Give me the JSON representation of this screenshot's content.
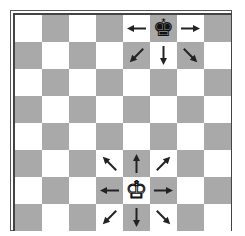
{
  "board": {
    "size": 8,
    "colors": {
      "light": "#ffffff",
      "dark": "#a9a9a9",
      "arrow": "#222222",
      "frame": "#444444"
    },
    "top_left_square": "light"
  },
  "pieces": [
    {
      "name": "black-king",
      "glyph": "♚",
      "color": "black",
      "col": 5,
      "row": 0,
      "square": "f8"
    },
    {
      "name": "white-king",
      "glyph": "♔",
      "color": "white",
      "col": 4,
      "row": 6,
      "square": "e2"
    }
  ],
  "arrows": [
    {
      "piece": "black-king",
      "col": 4,
      "row": 0,
      "dir": "w"
    },
    {
      "piece": "black-king",
      "col": 6,
      "row": 0,
      "dir": "e"
    },
    {
      "piece": "black-king",
      "col": 4,
      "row": 1,
      "dir": "sw"
    },
    {
      "piece": "black-king",
      "col": 5,
      "row": 1,
      "dir": "s"
    },
    {
      "piece": "black-king",
      "col": 6,
      "row": 1,
      "dir": "se"
    },
    {
      "piece": "white-king",
      "col": 3,
      "row": 5,
      "dir": "nw"
    },
    {
      "piece": "white-king",
      "col": 4,
      "row": 5,
      "dir": "n"
    },
    {
      "piece": "white-king",
      "col": 5,
      "row": 5,
      "dir": "ne"
    },
    {
      "piece": "white-king",
      "col": 3,
      "row": 6,
      "dir": "w"
    },
    {
      "piece": "white-king",
      "col": 5,
      "row": 6,
      "dir": "e"
    },
    {
      "piece": "white-king",
      "col": 3,
      "row": 7,
      "dir": "sw"
    },
    {
      "piece": "white-king",
      "col": 4,
      "row": 7,
      "dir": "s"
    },
    {
      "piece": "white-king",
      "col": 5,
      "row": 7,
      "dir": "se"
    }
  ]
}
